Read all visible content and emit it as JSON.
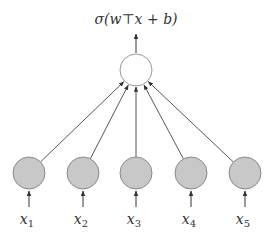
{
  "diagram": {
    "output_label": "σ(w⊤x + b)",
    "output_node": {
      "fill": "#ffffff",
      "stroke": "#999999"
    },
    "input_node_style": {
      "fill": "#c8c8c8",
      "stroke": "#888888"
    },
    "edge_color": "#444444",
    "inputs": [
      {
        "name": "x",
        "sub": "1"
      },
      {
        "name": "x",
        "sub": "2"
      },
      {
        "name": "x",
        "sub": "3"
      },
      {
        "name": "x",
        "sub": "4"
      },
      {
        "name": "x",
        "sub": "5"
      }
    ]
  }
}
